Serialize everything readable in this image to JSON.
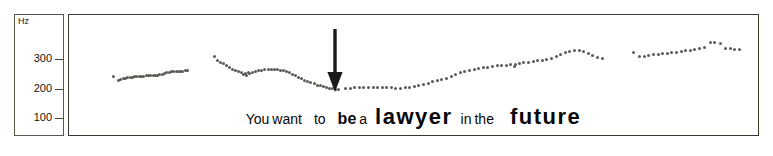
{
  "figure": {
    "unit_label": "Hz",
    "axis": {
      "ticks": [
        {
          "label": "300",
          "value": 300
        },
        {
          "label": "200",
          "value": 200
        },
        {
          "label": "100",
          "value": 100
        }
      ]
    },
    "annotation": {
      "type": "down-arrow",
      "color": "#1a1a1a"
    },
    "caption": {
      "words": [
        {
          "text": "You",
          "style": "sz-s",
          "gap": ""
        },
        {
          "text": "want",
          "style": "sz-s",
          "gap": "gap-xs"
        },
        {
          "text": "to",
          "style": "sz-s",
          "gap": "gap-m"
        },
        {
          "text": "be",
          "style": "sz-m",
          "gap": "gap-m"
        },
        {
          "text": "a",
          "style": "sz-s",
          "gap": "gap-xs"
        },
        {
          "text": "lawyer",
          "style": "sz-xl",
          "gap": "gap-s"
        },
        {
          "text": "in",
          "style": "sz-s",
          "gap": "gap-s"
        },
        {
          "text": "the",
          "style": "sz-s",
          "gap": "gap-xs"
        },
        {
          "text": "future",
          "style": "sz-xl",
          "gap": "gap-l"
        }
      ],
      "sentence": "You want to be a lawyer in the future"
    }
  },
  "chart_data": {
    "type": "scatter",
    "title": "",
    "xlabel": "",
    "ylabel": "Hz",
    "ylim": [
      0,
      400
    ],
    "grid": false,
    "legend": null,
    "axis_ticks": [
      300,
      200,
      100
    ],
    "units": "Hz",
    "series": [
      {
        "name": "You want",
        "points": [
          [
            27,
            196
          ],
          [
            34,
            183
          ],
          [
            37,
            186
          ],
          [
            40,
            188
          ],
          [
            43,
            190
          ],
          [
            46,
            191
          ],
          [
            49,
            192
          ],
          [
            52,
            193
          ],
          [
            55,
            194
          ],
          [
            58,
            194
          ],
          [
            61,
            195
          ],
          [
            64,
            196
          ],
          [
            67,
            196
          ],
          [
            70,
            197
          ],
          [
            73,
            197
          ],
          [
            76,
            198
          ],
          [
            79,
            198
          ],
          [
            82,
            199
          ],
          [
            85,
            200
          ],
          [
            88,
            201
          ],
          [
            91,
            203
          ],
          [
            94,
            205
          ],
          [
            97,
            207
          ],
          [
            100,
            209
          ],
          [
            103,
            211
          ],
          [
            106,
            212
          ],
          [
            109,
            213
          ],
          [
            112,
            213
          ],
          [
            115,
            213
          ],
          [
            118,
            213
          ],
          [
            121,
            214
          ],
          [
            124,
            214
          ]
        ]
      },
      {
        "name": "to",
        "points": [
          [
            159,
            262
          ],
          [
            163,
            248
          ],
          [
            167,
            243
          ],
          [
            171,
            238
          ],
          [
            175,
            231
          ],
          [
            179,
            225
          ],
          [
            183,
            220
          ],
          [
            187,
            216
          ],
          [
            191,
            212
          ],
          [
            195,
            209
          ],
          [
            199,
            206
          ],
          [
            203,
            207
          ]
        ]
      },
      {
        "name": "be a",
        "points": [
          [
            197,
            203
          ],
          [
            201,
            199
          ],
          [
            205,
            205
          ],
          [
            209,
            209
          ],
          [
            213,
            211
          ],
          [
            217,
            214
          ],
          [
            221,
            217
          ],
          [
            225,
            219
          ],
          [
            229,
            219
          ],
          [
            233,
            219
          ],
          [
            237,
            219
          ],
          [
            241,
            218
          ],
          [
            245,
            217
          ],
          [
            249,
            215
          ],
          [
            253,
            212
          ],
          [
            257,
            208
          ],
          [
            261,
            203
          ],
          [
            265,
            198
          ],
          [
            269,
            193
          ],
          [
            273,
            188
          ],
          [
            277,
            183
          ],
          [
            281,
            178
          ],
          [
            285,
            174
          ],
          [
            289,
            170
          ],
          [
            293,
            166
          ],
          [
            297,
            163
          ],
          [
            301,
            160
          ],
          [
            305,
            157
          ],
          [
            309,
            155
          ],
          [
            313,
            153
          ],
          [
            317,
            152
          ],
          [
            321,
            152
          ]
        ]
      },
      {
        "name": "lawyer",
        "points": [
          [
            330,
            154
          ],
          [
            336,
            156
          ],
          [
            342,
            157
          ],
          [
            348,
            157
          ],
          [
            354,
            157
          ],
          [
            360,
            157
          ],
          [
            366,
            157
          ],
          [
            372,
            157
          ],
          [
            378,
            158
          ],
          [
            384,
            158
          ],
          [
            390,
            157
          ],
          [
            396,
            156
          ],
          [
            402,
            156
          ],
          [
            408,
            157
          ],
          [
            414,
            159
          ],
          [
            420,
            162
          ],
          [
            426,
            165
          ],
          [
            432,
            169
          ],
          [
            438,
            173
          ],
          [
            444,
            177
          ],
          [
            450,
            181
          ],
          [
            456,
            185
          ],
          [
            462,
            190
          ],
          [
            468,
            196
          ],
          [
            474,
            202
          ],
          [
            480,
            207
          ],
          [
            486,
            211
          ],
          [
            492,
            215
          ],
          [
            498,
            218
          ],
          [
            504,
            221
          ],
          [
            510,
            224
          ],
          [
            516,
            227
          ],
          [
            522,
            229
          ],
          [
            528,
            231
          ],
          [
            534,
            233
          ],
          [
            540,
            234
          ],
          [
            546,
            236
          ],
          [
            552,
            236
          ]
        ]
      },
      {
        "name": "in the",
        "points": [
          [
            551,
            230
          ],
          [
            557,
            238
          ],
          [
            563,
            242
          ],
          [
            569,
            244
          ],
          [
            575,
            246
          ],
          [
            581,
            248
          ],
          [
            587,
            250
          ],
          [
            593,
            252
          ],
          [
            599,
            256
          ],
          [
            605,
            262
          ],
          [
            611,
            269
          ],
          [
            617,
            276
          ],
          [
            623,
            281
          ],
          [
            629,
            284
          ],
          [
            635,
            284
          ],
          [
            641,
            281
          ],
          [
            647,
            274
          ],
          [
            653,
            266
          ],
          [
            659,
            259
          ],
          [
            665,
            255
          ]
        ]
      },
      {
        "name": "future",
        "points": [
          [
            706,
            277
          ],
          [
            714,
            262
          ],
          [
            720,
            264
          ],
          [
            726,
            266
          ],
          [
            732,
            268
          ],
          [
            738,
            270
          ],
          [
            744,
            272
          ],
          [
            750,
            274
          ],
          [
            756,
            276
          ],
          [
            762,
            278
          ],
          [
            768,
            280
          ],
          [
            774,
            282
          ],
          [
            780,
            284
          ],
          [
            786,
            287
          ],
          [
            792,
            290
          ],
          [
            798,
            294
          ],
          [
            806,
            311
          ],
          [
            812,
            312
          ],
          [
            820,
            308
          ],
          [
            826,
            291
          ],
          [
            832,
            289
          ],
          [
            838,
            288
          ],
          [
            844,
            287
          ]
        ]
      }
    ]
  }
}
